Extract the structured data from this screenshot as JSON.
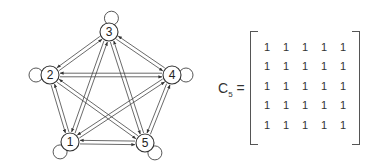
{
  "graph": {
    "title": "Complete directed graph with self-loops on 5 vertices",
    "nodes": [
      {
        "id": "1",
        "label": "1",
        "x": 70,
        "y": 142,
        "loop_angle": 225
      },
      {
        "id": "2",
        "label": "2",
        "x": 50,
        "y": 75,
        "loop_angle": 180
      },
      {
        "id": "3",
        "label": "3",
        "x": 109,
        "y": 32,
        "loop_angle": 80
      },
      {
        "id": "4",
        "label": "4",
        "x": 172,
        "y": 75,
        "loop_angle": 0
      },
      {
        "id": "5",
        "label": "5",
        "x": 145,
        "y": 143,
        "loop_angle": 315
      }
    ],
    "edges_description": "Every ordered pair of distinct vertices connected by a pair of opposite parallel arrows; each vertex has a self-loop"
  },
  "matrix": {
    "name": "C",
    "subscript": "5",
    "equals": "=",
    "rows": [
      [
        "1",
        "1",
        "1",
        "1",
        "1"
      ],
      [
        "1",
        "1",
        "1",
        "1",
        "1"
      ],
      [
        "1",
        "1",
        "1",
        "1",
        "1"
      ],
      [
        "1",
        "1",
        "1",
        "1",
        "1"
      ],
      [
        "1",
        "1",
        "1",
        "1",
        "1"
      ]
    ]
  }
}
